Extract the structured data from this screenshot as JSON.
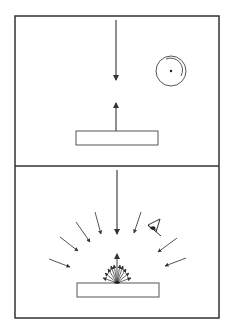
{
  "diagram": {
    "title": "",
    "colors": {
      "background": "#ffffff",
      "ink": "#333333"
    },
    "frame": {
      "x": 15,
      "y": 16,
      "width": 204,
      "height": 302
    },
    "divider_y": 166,
    "panels": [
      {
        "name": "specular-reflection",
        "surface": {
          "x": 76,
          "y": 131,
          "width": 82,
          "height": 14
        },
        "incident_ray": {
          "x1": 116,
          "y1": 20,
          "x2": 116,
          "y2": 80
        },
        "reflected_ray": {
          "x1": 116,
          "y1": 131,
          "x2": 116,
          "y2": 103
        },
        "viewer_icon": {
          "type": "eye-side-circle",
          "cx": 171,
          "cy": 71,
          "r": 15
        }
      },
      {
        "name": "diffuse-reflection",
        "surface": {
          "x": 77,
          "y": 283,
          "width": 82,
          "height": 14
        },
        "incident_ray": {
          "x1": 117,
          "y1": 170,
          "x2": 117,
          "y2": 234
        },
        "incoming_rays": [
          {
            "x1": 49,
            "y1": 259,
            "x2": 70,
            "y2": 267
          },
          {
            "x1": 60,
            "y1": 237,
            "x2": 78,
            "y2": 251
          },
          {
            "x1": 76,
            "y1": 222,
            "x2": 90,
            "y2": 242
          },
          {
            "x1": 95,
            "y1": 212,
            "x2": 101,
            "y2": 234
          },
          {
            "x1": 141,
            "y1": 212,
            "x2": 134,
            "y2": 233
          },
          {
            "x1": 177,
            "y1": 238,
            "x2": 158,
            "y2": 252
          },
          {
            "x1": 186,
            "y1": 258,
            "x2": 165,
            "y2": 266
          }
        ],
        "scatter_origin": {
          "x": 117,
          "y": 283
        },
        "scatter_rays": [
          {
            "x2": 117,
            "y2": 254
          },
          {
            "x2": 103,
            "y2": 278
          },
          {
            "x2": 105,
            "y2": 273
          },
          {
            "x2": 108,
            "y2": 269
          },
          {
            "x2": 111,
            "y2": 266
          },
          {
            "x2": 114,
            "y2": 265
          },
          {
            "x2": 120,
            "y2": 265
          },
          {
            "x2": 123,
            "y2": 266
          },
          {
            "x2": 126,
            "y2": 269
          },
          {
            "x2": 129,
            "y2": 273
          },
          {
            "x2": 131,
            "y2": 278
          }
        ],
        "viewer_icon": {
          "type": "eye-front",
          "x": 147,
          "y": 218
        }
      }
    ]
  }
}
